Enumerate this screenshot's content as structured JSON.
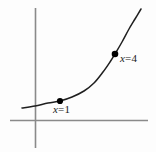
{
  "figure": {
    "width": 156,
    "height": 152,
    "background_color": "#fdfdfd",
    "axis_color": "#8a8a8a",
    "curve_color": "#1f1f1f",
    "point_color": "#000000",
    "label_color": "#1a1a1a"
  },
  "labels": {
    "point1": {
      "variable": "x",
      "equals": "=",
      "value": "1",
      "full": "x = 1"
    },
    "point2": {
      "variable": "x",
      "equals": "=",
      "value": "4",
      "full": "x = 4"
    }
  },
  "chart_data": {
    "type": "line",
    "title": "",
    "xlabel": "",
    "ylabel": "",
    "grid": false,
    "legend": "none",
    "axes": {
      "x_axis": {
        "pixel_y": 120,
        "pixel_x_start": 10,
        "pixel_x_end": 148,
        "ticks": [],
        "tick_labels": []
      },
      "y_axis": {
        "pixel_x": 35,
        "pixel_y_start": 8,
        "pixel_y_end": 148,
        "ticks": [],
        "tick_labels": []
      }
    },
    "curve_pixel_points": [
      [
        22,
        108
      ],
      [
        35,
        106
      ],
      [
        48,
        103
      ],
      [
        60,
        101
      ],
      [
        72,
        97
      ],
      [
        84,
        91
      ],
      [
        94,
        83
      ],
      [
        103,
        72
      ],
      [
        110,
        62
      ],
      [
        115,
        54
      ],
      [
        122,
        42
      ],
      [
        129,
        29
      ],
      [
        135,
        19
      ],
      [
        141,
        9
      ]
    ],
    "marked_points": [
      {
        "label": "x = 1",
        "x": 1,
        "pixel_x": 60,
        "pixel_y": 101,
        "label_pixel_x": 53,
        "label_pixel_y": 104,
        "label_position": "below-right"
      },
      {
        "label": "x = 4",
        "x": 4,
        "pixel_x": 115,
        "pixel_y": 54,
        "label_pixel_x": 120,
        "label_pixel_y": 53,
        "label_position": "right"
      }
    ]
  }
}
